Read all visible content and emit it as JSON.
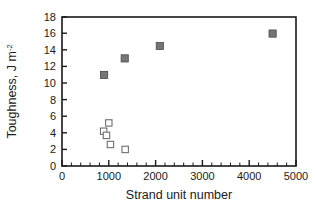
{
  "chart_data": {
    "type": "scatter",
    "title": "",
    "xlabel": "Strand unit number",
    "ylabel": "Toughness, J m-2",
    "ylabel_base": "Toughness, J m",
    "ylabel_sup": "-2",
    "xlim": [
      0,
      5000
    ],
    "ylim": [
      0,
      18
    ],
    "xticks": [
      0,
      1000,
      2000,
      3000,
      4000,
      5000
    ],
    "xticklabels": [
      "0",
      "1000",
      "2000",
      "3000",
      "4000",
      "5000"
    ],
    "yticks": [
      0,
      2,
      4,
      6,
      8,
      10,
      12,
      14,
      16,
      18
    ],
    "yticklabels": [
      "0",
      "2",
      "4",
      "6",
      "8",
      "10",
      "12",
      "14",
      "16",
      "18"
    ],
    "x_minor_interval": 200,
    "y_minor_ticks": false,
    "grid": false,
    "legend": "none",
    "series": [
      {
        "name": "filled-squares",
        "marker": "filled-square",
        "color": "#767676",
        "points": [
          {
            "x": 900,
            "y": 11.0
          },
          {
            "x": 1340,
            "y": 13.0
          },
          {
            "x": 2090,
            "y": 14.5
          },
          {
            "x": 4500,
            "y": 16.0
          }
        ]
      },
      {
        "name": "open-squares",
        "marker": "open-square",
        "color": "#ffffff",
        "points": [
          {
            "x": 1000,
            "y": 5.2
          },
          {
            "x": 890,
            "y": 4.2
          },
          {
            "x": 950,
            "y": 3.7
          },
          {
            "x": 1035,
            "y": 2.6
          },
          {
            "x": 1350,
            "y": 2.0
          }
        ]
      }
    ]
  },
  "colors": {
    "axis": "#1a1a1a",
    "filled_marker": "#767676",
    "open_marker_stroke": "#6e6e6e",
    "background": "#ffffff"
  }
}
